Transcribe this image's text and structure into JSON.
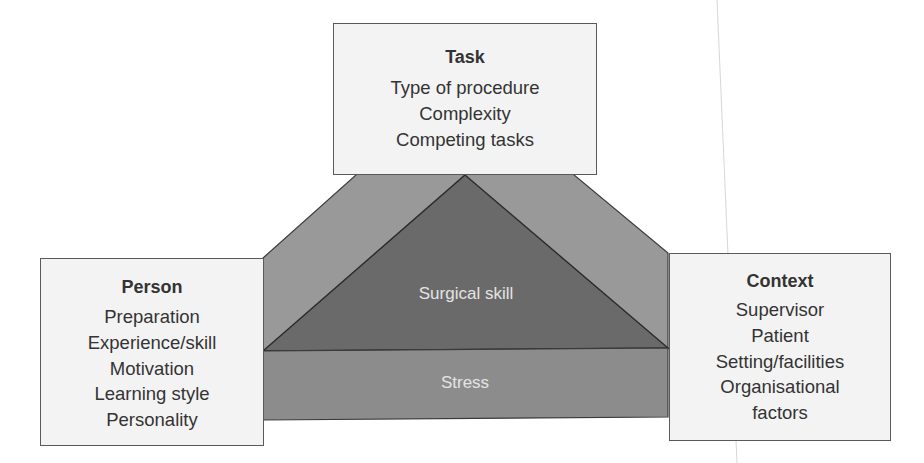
{
  "diagram": {
    "colors": {
      "side_panels": "#999999",
      "triangle": "#6a6a6a",
      "stress_band": "#8c8c8c",
      "box_fill": "#f3f3f3",
      "box_border": "#5a5a5a",
      "text": "#333333",
      "center_text": "#e4e4e4"
    },
    "task": {
      "title": "Task",
      "items": [
        "Type of procedure",
        "Complexity",
        "Competing tasks"
      ]
    },
    "person": {
      "title": "Person",
      "items": [
        "Preparation",
        "Experience/skill",
        "Motivation",
        "Learning style",
        "Personality"
      ]
    },
    "context": {
      "title": "Context",
      "items": [
        "Supervisor",
        "Patient",
        "Setting/facilities",
        "Organisational",
        "factors"
      ]
    },
    "center": {
      "triangle_label": "Surgical skill",
      "band_label": "Stress"
    }
  }
}
